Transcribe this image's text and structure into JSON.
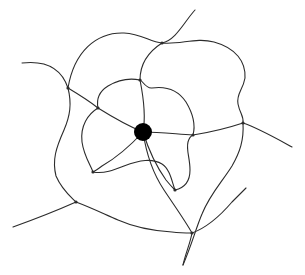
{
  "figure": {
    "background_color": "#ffffff",
    "width": 305,
    "height": 275
  },
  "style": {
    "stroke_color": "#2b2b2b",
    "stroke_width": 1.1,
    "vertex_color": "#000000"
  },
  "chart_data": {
    "type": "diagram",
    "xlabel": "",
    "ylabel": "",
    "xlim": [
      0,
      305
    ],
    "ylim": [
      0,
      275
    ],
    "grid": false,
    "legend": null,
    "annotations": [],
    "central_vertex": {
      "label": "center-node",
      "x": 143,
      "y": 132,
      "radius": 9,
      "color": "#000000"
    },
    "intersection_nodes": [
      {
        "label": "node-top",
        "x": 162,
        "y": 43
      },
      {
        "label": "node-upper-left",
        "x": 68,
        "y": 88
      },
      {
        "label": "node-mid-left",
        "x": 98,
        "y": 108
      },
      {
        "label": "node-upper-center",
        "x": 140,
        "y": 80
      },
      {
        "label": "node-right",
        "x": 243,
        "y": 123
      },
      {
        "label": "node-mid-right",
        "x": 193,
        "y": 135
      },
      {
        "label": "node-lower-left",
        "x": 93,
        "y": 172
      },
      {
        "label": "node-bottom-left",
        "x": 76,
        "y": 202
      },
      {
        "label": "node-lower-center",
        "x": 175,
        "y": 190
      },
      {
        "label": "node-bottom",
        "x": 192,
        "y": 233
      }
    ],
    "open_endpoints": [
      {
        "label": "endpoint-top",
        "x": 195,
        "y": 10
      },
      {
        "label": "endpoint-left",
        "x": 22,
        "y": 63
      },
      {
        "label": "endpoint-right",
        "x": 292,
        "y": 147
      },
      {
        "label": "endpoint-bottom-left",
        "x": 13,
        "y": 227
      },
      {
        "label": "endpoint-bottom-center",
        "x": 183,
        "y": 265
      },
      {
        "label": "endpoint-bottom-right",
        "x": 246,
        "y": 188
      }
    ],
    "curves": [
      {
        "label": "curve-outer-top-loop",
        "path": "M 22 63 C 48 60 62 70 68 88 C 74 52 96 32 124 33 C 142 34 150 42 162 43 C 176 40 184 22 195 10"
      },
      {
        "label": "curve-big-right-lobe",
        "path": "M 162 43 C 180 45 196 37 214 42 C 236 48 246 62 245 78 C 243 90 236 94 238 104 C 240 114 244 116 243 123"
      },
      {
        "label": "curve-right-tail",
        "path": "M 243 123 C 258 128 272 136 292 147"
      },
      {
        "label": "curve-right-descend",
        "path": "M 243 123 C 244 140 240 152 232 166 C 222 182 210 194 202 214 C 196 228 192 244 183 265"
      },
      {
        "label": "curve-left-vertical-outer",
        "path": "M 68 88 C 72 104 70 116 64 130 C 56 148 52 160 56 176 C 62 190 70 196 76 202"
      },
      {
        "label": "curve-bottom-left-tail",
        "path": "M 76 202 C 58 210 38 218 13 227"
      },
      {
        "label": "curve-bottom-sweep",
        "path": "M 76 202 C 92 208 104 214 118 220 C 136 228 156 231 172 232 C 180 233 186 233 192 233"
      },
      {
        "label": "curve-bottom-right-end",
        "path": "M 192 233 C 206 228 220 216 232 202 C 238 196 242 192 246 188"
      },
      {
        "label": "curve-bottom-vertical",
        "path": "M 192 233 C 190 244 186 252 183 265"
      },
      {
        "label": "curve-center-up-right",
        "path": "M 143 132 C 146 116 144 100 140 80 C 140 64 148 52 162 43"
      },
      {
        "label": "curve-center-left-spoke",
        "path": "M 143 132 C 128 126 114 118 98 108 C 88 100 78 94 68 88"
      },
      {
        "label": "curve-center-right-spoke",
        "path": "M 143 132 C 160 132 176 134 193 135 C 212 132 228 128 243 123"
      },
      {
        "label": "curve-center-down-left",
        "path": "M 143 132 C 130 146 116 158 102 166 C 98 169 95 171 93 172"
      },
      {
        "label": "curve-center-down-right",
        "path": "M 143 132 C 148 148 156 166 166 180 C 170 185 173 188 175 190"
      },
      {
        "label": "curve-center-down",
        "path": "M 143 132 C 146 152 152 172 164 190 C 176 208 186 222 192 233"
      },
      {
        "label": "curve-inner-left-loop",
        "path": "M 98 108 C 88 114 80 126 82 142 C 84 156 90 164 93 172"
      },
      {
        "label": "curve-inner-lower-loop",
        "path": "M 93 172 C 104 174 114 170 124 166 C 140 160 152 158 162 164 C 170 169 172 182 175 190"
      },
      {
        "label": "curve-inner-right-wiggle",
        "path": "M 175 190 C 184 188 190 182 190 170 C 190 158 186 150 188 142 C 189 138 191 136 193 135"
      },
      {
        "label": "curve-inner-right-upper",
        "path": "M 193 135 C 196 124 192 112 186 102 C 178 90 166 86 152 88 C 146 89 142 80 140 80"
      },
      {
        "label": "curve-inner-top-left",
        "path": "M 140 80 C 130 78 118 80 108 86 C 100 91 96 98 98 108"
      }
    ]
  }
}
